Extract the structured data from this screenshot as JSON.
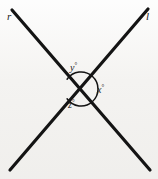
{
  "figure": {
    "type": "geometry-diagram",
    "background_color": "#f4f3f1",
    "stroke_color": "#141414",
    "lines": [
      {
        "name": "r",
        "label": "r",
        "x1": 12,
        "y1": 10,
        "x2": 150,
        "y2": 170
      },
      {
        "name": "l",
        "label": "l",
        "x1": 148,
        "y1": 9,
        "x2": 10,
        "y2": 170
      }
    ],
    "intersection": {
      "x": 81,
      "y": 89
    },
    "angles": [
      {
        "name": "y",
        "label": "y",
        "degree_symbol": "°",
        "position": "top"
      },
      {
        "name": "x",
        "label": "x",
        "degree_symbol": "°",
        "position": "right"
      },
      {
        "name": "z",
        "label": "z",
        "degree_symbol": "°",
        "position": "bottom"
      }
    ],
    "arc": {
      "radius": 17,
      "open_side": "left"
    }
  }
}
